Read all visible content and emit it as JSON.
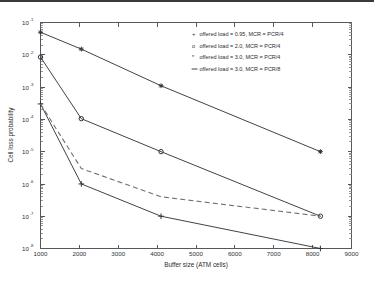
{
  "figure": {
    "background_color": "#ffffff",
    "axis_color": "#55585c",
    "line_color": "#404448",
    "dashed_color": "#6e7277"
  },
  "chart_data": {
    "type": "line",
    "title": "",
    "xlabel": "Buffer size (ATM cells)",
    "ylabel": "Cell loss probability",
    "xscale": "linear",
    "yscale": "log",
    "xlim": [
      1000,
      9000
    ],
    "ylim": [
      1e-08,
      0.1
    ],
    "xticks": [
      1000,
      2000,
      3000,
      4000,
      5000,
      6000,
      7000,
      8000,
      9000
    ],
    "xticklabels": [
      "1000",
      "2000",
      "3000",
      "4000",
      "5000",
      "6000",
      "7000",
      "8000",
      "9000"
    ],
    "yticks": [
      1e-08,
      1e-07,
      1e-06,
      1e-05,
      0.0001,
      0.001,
      0.01,
      0.1
    ],
    "yticklabels": [
      "10^-8",
      "10^-7",
      "10^-6",
      "10^-5",
      "10^-4",
      "10^-3",
      "10^-2",
      "10^-1"
    ],
    "grid": false,
    "legend_position": "upper right",
    "series": [
      {
        "name": "offered load = 0.95, MCR = PCR/4",
        "marker": "+",
        "linestyle": "solid",
        "x": [
          1000,
          2050,
          4100,
          8200
        ],
        "y": [
          0.0003,
          1e-06,
          1e-07,
          1e-08
        ]
      },
      {
        "name": "offered load = 2.0, MCR = PCR/4",
        "marker": "o",
        "linestyle": "solid",
        "x": [
          1000,
          2050,
          4100,
          8200
        ],
        "y": [
          0.0085,
          0.000105,
          1e-05,
          1e-07
        ]
      },
      {
        "name": "offered load = 3.0, MCR = PCR/4",
        "marker": "*",
        "linestyle": "solid",
        "x": [
          1000,
          2050,
          4100,
          8200
        ],
        "y": [
          0.05,
          0.015,
          0.0011,
          1e-05
        ]
      },
      {
        "name": "offered load = 3.0, MCR = PCR/8",
        "marker": "none",
        "linestyle": "dashed",
        "x": [
          1000,
          2050,
          4100,
          8200
        ],
        "y": [
          0.0003,
          3e-06,
          4e-07,
          1e-07
        ]
      }
    ]
  },
  "legend": {
    "entries": [
      {
        "symbol": "+",
        "label": "offered load = 0.95, MCR = PCR/4"
      },
      {
        "symbol": "o",
        "label": "offered load = 2.0, MCR = PCR/4"
      },
      {
        "symbol": "*",
        "label": "offered load = 3.0, MCR = PCR/4"
      },
      {
        "symbol": "--",
        "label": "offered load = 3.0, MCR = PCR/8"
      }
    ]
  },
  "axis_labels": {
    "x_title": "Buffer size (ATM cells)",
    "y_title": "Cell loss probability",
    "x_tick_1000": "1000",
    "x_tick_2000": "2000",
    "x_tick_3000": "3000",
    "x_tick_4000": "4000",
    "x_tick_5000": "5000",
    "x_tick_6000": "6000",
    "x_tick_7000": "7000",
    "x_tick_8000": "8000",
    "x_tick_9000": "9000",
    "y_base": "10",
    "y_exp_1": "-1",
    "y_exp_2": "-2",
    "y_exp_3": "-3",
    "y_exp_4": "-4",
    "y_exp_5": "-5",
    "y_exp_6": "-6",
    "y_exp_7": "-7",
    "y_exp_8": "-8"
  }
}
